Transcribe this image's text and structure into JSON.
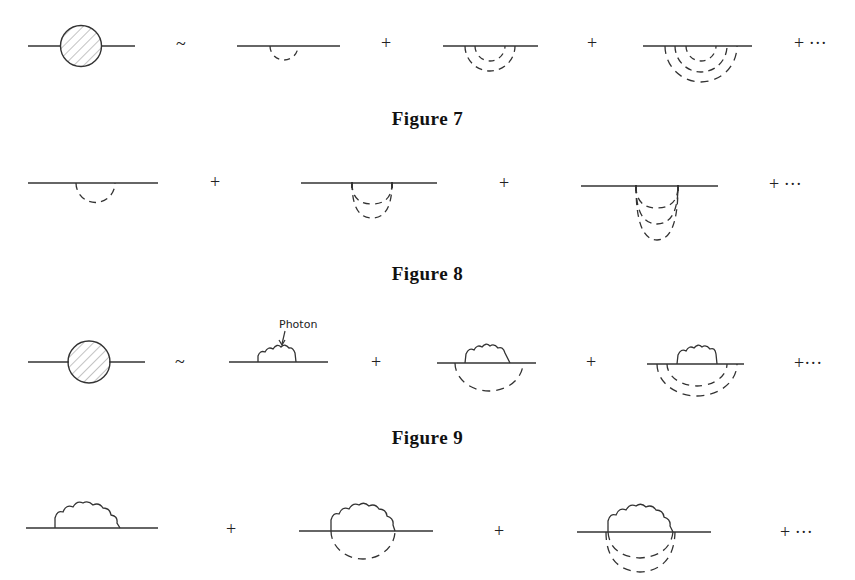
{
  "figures": [
    {
      "caption": "Figure 7",
      "description": "Dressed propagator (hatched blob) approximated by sum of diagrams with increasing number of nested dashed phonon lines",
      "terms": [
        "blob",
        "~",
        "1 dashed loop",
        "+",
        "2 nested dashed loops",
        "+",
        "3 nested dashed loops",
        "+ ···"
      ],
      "operators": {
        "approx": "~",
        "plus1": "+",
        "plus2": "+",
        "ellipsis": "+ ···"
      }
    },
    {
      "caption": "Figure 8",
      "description": "Series of diagrams with dashed lines sharing the same endpoints (1, 2, 3 stacked dashed arcs)",
      "terms": [
        "1 dashed arc",
        "+",
        "2 stacked dashed arcs",
        "+",
        "3 stacked dashed arcs",
        "+ ···"
      ],
      "operators": {
        "plus1": "+",
        "plus2": "+",
        "ellipsis": "+  ···"
      }
    },
    {
      "caption": "Figure 9",
      "description": "Dressed propagator approximated by photon self-energy diagram plus diagrams with nested dashed lines",
      "annotation": "Photon",
      "terms": [
        "blob",
        "~",
        "photon loop",
        "+",
        "photon loop + 1 dashed",
        "+",
        "photon loop + 2 dashed",
        "+···"
      ],
      "operators": {
        "approx": "~",
        "plus1": "+",
        "plus2": "+",
        "ellipsis": "+···"
      }
    },
    {
      "caption": "",
      "description": "Photon self-energy with increasing number of dashed arcs sharing vertices",
      "terms": [
        "photon loop",
        "+",
        "photon loop + 1 dashed",
        "+",
        "photon loop + 2 dashed",
        "+ ···"
      ],
      "operators": {
        "plus1": "+",
        "plus2": "+",
        "ellipsis": "+  ···"
      }
    }
  ]
}
